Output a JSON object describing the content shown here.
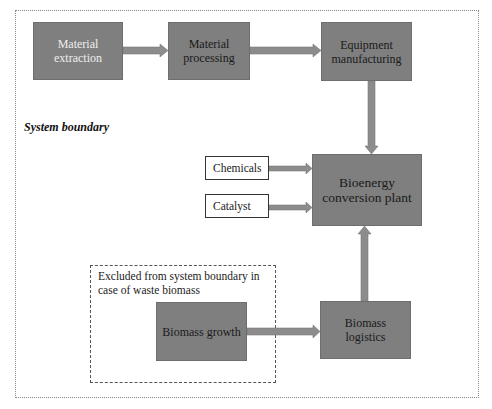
{
  "diagram": {
    "boundary_label": "System boundary",
    "excluded_label": "Excluded from system boundary in case of waste biomass",
    "nodes": {
      "material_extraction": "Material extraction",
      "material_processing": "Material processing",
      "equipment_manufacturing": "Equipment manufacturing",
      "bioenergy_plant": "Bioenergy conversion plant",
      "chemicals": "Chemicals",
      "catalyst": "Catalyst",
      "biomass_growth": "Biomass growth",
      "biomass_logistics": "Biomass logistics"
    },
    "edges": [
      {
        "from": "Material extraction",
        "to": "Material processing"
      },
      {
        "from": "Material processing",
        "to": "Equipment manufacturing"
      },
      {
        "from": "Equipment manufacturing",
        "to": "Bioenergy conversion plant"
      },
      {
        "from": "Chemicals",
        "to": "Bioenergy conversion plant"
      },
      {
        "from": "Catalyst",
        "to": "Bioenergy conversion plant"
      },
      {
        "from": "Biomass growth",
        "to": "Biomass logistics"
      },
      {
        "from": "Biomass logistics",
        "to": "Bioenergy conversion plant"
      }
    ],
    "colors": {
      "process_box": "#7f7f7f",
      "arrow": "#8c8c8c",
      "input_box": "#ffffff"
    }
  }
}
